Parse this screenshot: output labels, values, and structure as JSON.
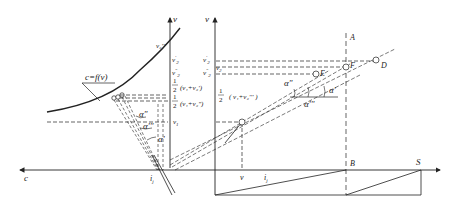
{
  "diagram": {
    "left_panel": {
      "axis_v_label": "v",
      "axis_c_label": "c",
      "curve_label": "c=f(v)",
      "origin_label": "i",
      "origin_sub": "j",
      "tick_labels": {
        "v2p": "v",
        "v2p_sup": "'",
        "v2p_sub": "2",
        "v2pp": "v",
        "v2pp_sup": "\"",
        "v2pp_sub": "2",
        "half1": "1",
        "half1_den": "2",
        "half1_expr": "(v₁+v₂')",
        "half2": "1",
        "half2_den": "2",
        "half2_expr": "(v₁+v₂\")",
        "v1": "v",
        "v1_sub": "1"
      },
      "curve_point_label": "v₂'''",
      "angles": [
        "α\"",
        "α'''",
        "α'"
      ]
    },
    "right_panel": {
      "axis_v_label": "v",
      "tick_labels": {
        "v2p": "v₂'",
        "v2ppp": "v₂'''",
        "v2pp": "v₂\"",
        "half_num": "1",
        "half_den": "2",
        "half_expr": "( v₁+v₂''' )"
      },
      "point_labels": {
        "A": "A",
        "B": "B",
        "D": "D",
        "E": "E",
        "F": "F",
        "S": "S"
      },
      "angles": [
        "α\"",
        "α'",
        "α'''"
      ],
      "bottom_labels": {
        "v": "v",
        "i": "i",
        "i_sub": "j"
      }
    }
  }
}
